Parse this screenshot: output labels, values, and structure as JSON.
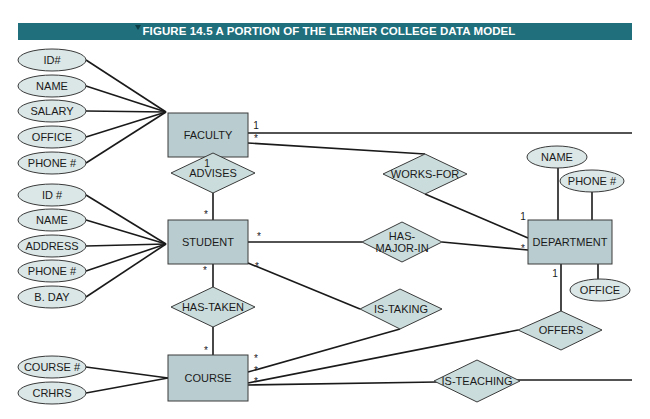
{
  "figure": {
    "title": "FIGURE 14.5 A PORTION OF THE LERNER COLLEGE DATA MODEL",
    "banner_color": "#1f6f7c"
  },
  "colors": {
    "entity_fill": "#b9cdd0",
    "attribute_fill": "#dbe6e6",
    "relationship_fill": "#cbdcdc",
    "line": "#1a1a1a"
  },
  "entities": {
    "faculty": {
      "label": "FACULTY",
      "x": 168,
      "y": 113,
      "w": 80,
      "h": 44
    },
    "student": {
      "label": "STUDENT",
      "x": 168,
      "y": 220,
      "w": 80,
      "h": 44
    },
    "course": {
      "label": "COURSE",
      "x": 168,
      "y": 355,
      "w": 80,
      "h": 46
    },
    "department": {
      "label": "DEPARTMENT",
      "x": 528,
      "y": 220,
      "w": 84,
      "h": 44
    }
  },
  "attributes": {
    "faculty": [
      {
        "label": "ID#",
        "cx": 52,
        "cy": 60
      },
      {
        "label": "NAME",
        "cx": 52,
        "cy": 86
      },
      {
        "label": "SALARY",
        "cx": 52,
        "cy": 111
      },
      {
        "label": "OFFICE",
        "cx": 52,
        "cy": 137
      },
      {
        "label": "PHONE #",
        "cx": 52,
        "cy": 163
      }
    ],
    "student": [
      {
        "label": "ID #",
        "cx": 52,
        "cy": 195
      },
      {
        "label": "NAME",
        "cx": 52,
        "cy": 220
      },
      {
        "label": "ADDRESS",
        "cx": 52,
        "cy": 246
      },
      {
        "label": "PHONE #",
        "cx": 52,
        "cy": 271
      },
      {
        "label": "B. DAY",
        "cx": 52,
        "cy": 297
      }
    ],
    "course": [
      {
        "label": "COURSE #",
        "cx": 52,
        "cy": 367
      },
      {
        "label": "CRHRS",
        "cx": 52,
        "cy": 393
      }
    ],
    "department": [
      {
        "label": "NAME",
        "cx": 555,
        "cy": 157
      },
      {
        "label": "PHONE #",
        "cx": 590,
        "cy": 181
      },
      {
        "label": "OFFICE",
        "cx": 595,
        "cy": 290
      }
    ]
  },
  "relationships": [
    {
      "id": "advises",
      "label": "ADVISES",
      "cx": 208,
      "cy": 173
    },
    {
      "id": "works-for",
      "label": "WORKS-FOR",
      "cx": 425,
      "cy": 174
    },
    {
      "id": "has-major-in",
      "label": "HAS-\nMAJOR-IN",
      "line1": "HAS-",
      "line2": "MAJOR-IN",
      "cx": 402,
      "cy": 242
    },
    {
      "id": "has-taken",
      "label": "HAS-TAKEN",
      "cx": 212,
      "cy": 307
    },
    {
      "id": "is-taking",
      "label": "IS-TAKING",
      "cx": 400,
      "cy": 309
    },
    {
      "id": "offers",
      "label": "OFFERS",
      "cx": 561,
      "cy": 330
    },
    {
      "id": "is-teaching",
      "label": "IS-TEACHING",
      "cx": 477,
      "cy": 380
    }
  ],
  "cardinalities": [
    {
      "where": "faculty-right-top",
      "value": "1"
    },
    {
      "where": "faculty-right-works-for",
      "value": "*"
    },
    {
      "where": "faculty-bottom-advises",
      "value": "1"
    },
    {
      "where": "student-top-advises",
      "value": "*"
    },
    {
      "where": "student-right-has-major-in",
      "value": "*"
    },
    {
      "where": "student-right-is-taking",
      "value": "*"
    },
    {
      "where": "student-bottom-has-taken",
      "value": "*"
    },
    {
      "where": "course-top-has-taken",
      "value": "*"
    },
    {
      "where": "course-right-is-taking",
      "value": "*"
    },
    {
      "where": "course-right-offers",
      "value": "*"
    },
    {
      "where": "course-right-is-teaching",
      "value": "*"
    },
    {
      "where": "department-left-works-for",
      "value": "1"
    },
    {
      "where": "department-left-has-major-in",
      "value": "*"
    },
    {
      "where": "department-bottom-offers",
      "value": "1"
    }
  ]
}
